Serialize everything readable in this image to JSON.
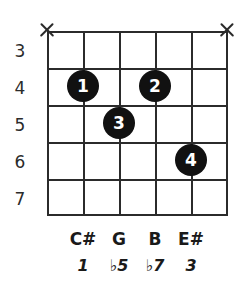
{
  "diagram": {
    "type": "guitar-chord-diagram",
    "instrument": "guitar",
    "string_count": 6,
    "fret_count": 5,
    "colors": {
      "background": "#ffffff",
      "grid": "#2b2b2b",
      "dot_fill": "#111111",
      "dot_text": "#ffffff",
      "text": "#1a1a1a"
    }
  },
  "fret_numbers": [
    {
      "label": "3"
    },
    {
      "label": "4"
    },
    {
      "label": "5"
    },
    {
      "label": "6"
    },
    {
      "label": "7"
    }
  ],
  "muted_strings": [
    {
      "string": 1,
      "marker": "X"
    },
    {
      "string": 6,
      "marker": "X"
    }
  ],
  "finger_dots": [
    {
      "finger": "1",
      "string": 2,
      "fret": 4
    },
    {
      "finger": "2",
      "string": 4,
      "fret": 4
    },
    {
      "finger": "3",
      "string": 3,
      "fret": 5
    },
    {
      "finger": "4",
      "string": 5,
      "fret": 6
    }
  ],
  "note_labels": [
    {
      "string": 2,
      "note": "C#",
      "interval": "♭5"
    },
    {
      "string": 3,
      "note": "G",
      "interval": "♭5"
    },
    {
      "string": 4,
      "note": "B",
      "interval": "♭7"
    },
    {
      "string": 5,
      "note": "E#",
      "interval": "3"
    }
  ],
  "notes_row": [
    {
      "text": "C#"
    },
    {
      "text": "G"
    },
    {
      "text": "B"
    },
    {
      "text": "E#"
    }
  ],
  "intervals_row": [
    {
      "text": "1"
    },
    {
      "text": "♭5"
    },
    {
      "text": "♭7"
    },
    {
      "text": "3"
    }
  ]
}
